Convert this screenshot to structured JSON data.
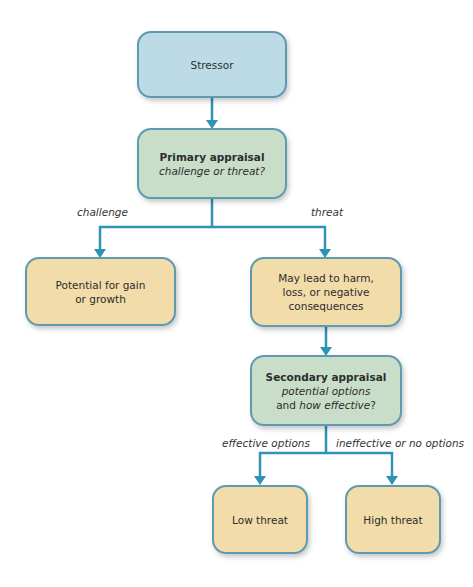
{
  "diagram": {
    "colors": {
      "stressor_fill": "#bcdbe6",
      "appraisal_fill": "#c8dec9",
      "outcome_fill": "#f1dcaa",
      "border": "#5f9bb0",
      "connector": "#2e93b7"
    },
    "nodes": {
      "stressor": {
        "text": "Stressor"
      },
      "primary": {
        "title": "Primary appraisal",
        "subtitle": "challenge or threat?"
      },
      "gain": {
        "line1": "Potential for gain",
        "line2": "or growth"
      },
      "harm": {
        "line1": "May lead to harm,",
        "line2": "loss, or negative",
        "line3": "consequences"
      },
      "secondary": {
        "title": "Secondary appraisal",
        "line2": "potential options",
        "line3_plain": "and ",
        "line3_italic": "how effective",
        "line3_end": "?"
      },
      "low": {
        "text": "Low threat"
      },
      "high": {
        "text": "High threat"
      }
    },
    "edge_labels": {
      "challenge": "challenge",
      "threat": "threat",
      "effective": "effective options",
      "ineffective": "ineffective or no options"
    }
  }
}
